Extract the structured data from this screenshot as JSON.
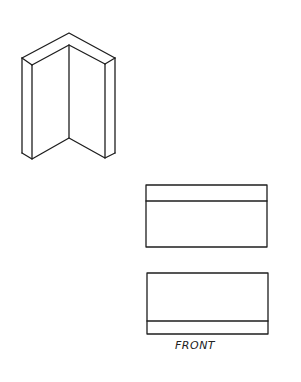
{
  "figure": {
    "type": "orthographic-and-isometric-drawing",
    "isometric_view": {
      "shape": "L-shaped angle (corner piece)",
      "outer_top_apex": [
        69,
        33
      ],
      "inner_top_apex": [
        69,
        45
      ],
      "outer_left_top": [
        22,
        58
      ],
      "inner_left_top": [
        32,
        65
      ],
      "outer_right_top": [
        115,
        58
      ],
      "inner_right_top": [
        105,
        64
      ],
      "outer_left_bottom": [
        22,
        153
      ],
      "inner_left_bottom": [
        32,
        159
      ],
      "center_bottom": [
        69,
        138
      ],
      "inner_right_bottom": [
        105,
        158
      ],
      "outer_right_bottom": [
        115,
        153
      ]
    },
    "top_view": {
      "x": 146,
      "y": 185,
      "width": 121,
      "height": 62,
      "inner_line_y": 201
    },
    "front_view": {
      "x": 147,
      "y": 273,
      "width": 121,
      "height": 61,
      "inner_line_y": 321,
      "label": "FRONT"
    },
    "colors": {
      "line": "#1e1e1e",
      "background": "#ffffff"
    }
  }
}
